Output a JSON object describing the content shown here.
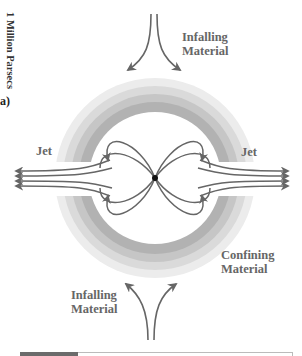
{
  "figure": {
    "scale_label": "1 Million Parsecs",
    "panel_label": "a)",
    "labels": {
      "infalling_top": "Infalling\nMaterial",
      "infalling_top_line1": "Infalling",
      "infalling_top_line2": "Material",
      "jet_left": "Jet",
      "jet_right": "Jet",
      "confining_line1": "Confining",
      "confining_line2": "Material",
      "infalling_bottom_line1": "Infalling",
      "infalling_bottom_line2": "Material"
    },
    "colors": {
      "line": "#666666",
      "ring_outer": "#e6e6e6",
      "ring_mid1": "#d2d2d2",
      "ring_mid2": "#bdbdbd",
      "ring_inner": "#a8a8a8",
      "core": "#111111",
      "label_text": "#666666"
    },
    "elements": [
      "central black hole",
      "magnetic field loops",
      "bipolar jets",
      "confining torus",
      "infalling material flows"
    ]
  }
}
